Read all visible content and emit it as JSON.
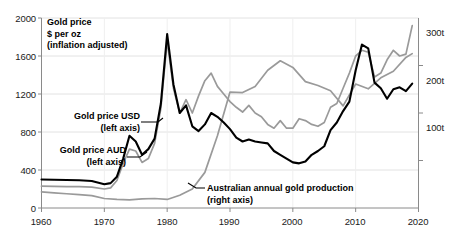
{
  "chart_data": {
    "type": "line",
    "title": "Gold price\n$ per oz\n(inflation adjusted)",
    "xlabel": "",
    "ylabel": "Gold price $ per oz (inflation adjusted)",
    "y2label": "Australian annual gold production (tonnes)",
    "xlim": [
      1960,
      2020
    ],
    "ylim": [
      0,
      2000
    ],
    "y2lim": [
      0,
      400
    ],
    "grid": true,
    "legend_position": "inline-annotations",
    "x_ticks": [
      "1960",
      "1970",
      "1980",
      "1990",
      "2000",
      "2010",
      "2020"
    ],
    "x_tick_values": [
      1960,
      1970,
      1980,
      1990,
      2000,
      2010,
      2020
    ],
    "y_left_ticks": [
      "0",
      "400",
      "800",
      "1200",
      "1600",
      "2000"
    ],
    "y_left_tick_values": [
      0,
      400,
      800,
      1200,
      1600,
      2000
    ],
    "y_right_ticks": [
      "100t",
      "200t",
      "300t"
    ],
    "y_right_tick_values": [
      100,
      200,
      300
    ],
    "annotations": [
      {
        "id": "title-block",
        "text_lines": [
          "Gold price",
          "$ per oz",
          "(inflation adjusted)"
        ]
      },
      {
        "id": "usd-label",
        "text_lines": [
          "Gold price USD",
          "(left axis)"
        ]
      },
      {
        "id": "aud-label",
        "text_lines": [
          "Gold price AUD",
          "(left axis)"
        ]
      },
      {
        "id": "production-label",
        "text_lines": [
          "Australian annual gold production",
          "(right axis)"
        ]
      }
    ],
    "colors": {
      "gold_price_usd": "#000000",
      "gold_price_aud": "#9a9a9a",
      "production": "#9a9a9a",
      "grid": "#e2e2e2",
      "axis": "#8a8a8a",
      "text": "#111111"
    },
    "series": [
      {
        "name": "Gold price USD (left axis)",
        "axis": "left",
        "color": "#000000",
        "unit": "USD per oz (inflation adjusted)",
        "x": [
          1960,
          1962,
          1964,
          1966,
          1968,
          1970,
          1971,
          1972,
          1973,
          1974,
          1975,
          1976,
          1977,
          1978,
          1979,
          1980,
          1981,
          1982,
          1983,
          1984,
          1985,
          1986,
          1987,
          1988,
          1989,
          1990,
          1991,
          1992,
          1993,
          1994,
          1995,
          1996,
          1997,
          1998,
          1999,
          2000,
          2001,
          2002,
          2003,
          2004,
          2005,
          2006,
          2007,
          2008,
          2009,
          2010,
          2011,
          2012,
          2013,
          2014,
          2015,
          2016,
          2017,
          2018,
          2019
        ],
        "y": [
          300,
          298,
          295,
          292,
          285,
          250,
          262,
          330,
          520,
          760,
          700,
          560,
          620,
          730,
          1100,
          1830,
          1300,
          1000,
          1080,
          860,
          810,
          880,
          1000,
          960,
          900,
          830,
          740,
          700,
          720,
          700,
          690,
          680,
          600,
          560,
          520,
          480,
          470,
          490,
          560,
          600,
          650,
          820,
          900,
          1020,
          1120,
          1450,
          1720,
          1680,
          1320,
          1260,
          1150,
          1250,
          1270,
          1230,
          1310
        ]
      },
      {
        "name": "Gold price AUD (left axis)",
        "axis": "left",
        "color": "#9a9a9a",
        "unit": "AUD per oz (inflation adjusted)",
        "x": [
          1960,
          1962,
          1964,
          1966,
          1968,
          1970,
          1971,
          1972,
          1973,
          1974,
          1975,
          1976,
          1977,
          1978,
          1979,
          1980,
          1981,
          1982,
          1983,
          1984,
          1985,
          1986,
          1987,
          1988,
          1989,
          1990,
          1991,
          1992,
          1993,
          1994,
          1995,
          1996,
          1997,
          1998,
          1999,
          2000,
          2001,
          2002,
          2003,
          2004,
          2005,
          2006,
          2007,
          2008,
          2009,
          2010,
          2011,
          2012,
          2013,
          2014,
          2015,
          2016,
          2017,
          2018,
          2019
        ],
        "y": [
          230,
          228,
          226,
          224,
          220,
          200,
          212,
          290,
          470,
          620,
          600,
          480,
          520,
          680,
          1050,
          1760,
          1260,
          1000,
          1140,
          1000,
          1180,
          1340,
          1420,
          1280,
          1200,
          1120,
          1060,
          1010,
          1080,
          1000,
          960,
          880,
          840,
          920,
          840,
          840,
          940,
          920,
          880,
          860,
          900,
          1060,
          1100,
          1260,
          1420,
          1600,
          1660,
          1640,
          1380,
          1420,
          1560,
          1660,
          1600,
          1620,
          1920
        ]
      },
      {
        "name": "Australian annual gold production (right axis)",
        "axis": "right",
        "color": "#9a9a9a",
        "unit": "tonnes",
        "x": [
          1960,
          1962,
          1964,
          1966,
          1968,
          1970,
          1972,
          1974,
          1976,
          1978,
          1980,
          1982,
          1984,
          1986,
          1988,
          1990,
          1992,
          1994,
          1996,
          1998,
          2000,
          2002,
          2004,
          2006,
          2008,
          2010,
          2012,
          2014,
          2016,
          2018,
          2019
        ],
        "y": [
          34,
          32,
          30,
          28,
          26,
          20,
          18,
          17,
          19,
          20,
          18,
          27,
          40,
          75,
          152,
          244,
          243,
          256,
          290,
          310,
          296,
          266,
          258,
          247,
          215,
          261,
          251,
          274,
          288,
          317,
          325
        ]
      }
    ]
  },
  "axis_labels": {
    "left": [
      {
        "value": 2000,
        "text": "2000"
      },
      {
        "value": 1600,
        "text": "1600"
      },
      {
        "value": 1200,
        "text": "1200"
      },
      {
        "value": 800,
        "text": "800"
      },
      {
        "value": 400,
        "text": "400"
      },
      {
        "value": 0,
        "text": "0"
      }
    ],
    "right": [
      {
        "value": 300,
        "text": "300t"
      },
      {
        "value": 200,
        "text": "200t"
      },
      {
        "value": 100,
        "text": "100t"
      }
    ],
    "bottom": [
      {
        "value": 1960,
        "text": "1960"
      },
      {
        "value": 1970,
        "text": "1970"
      },
      {
        "value": 1980,
        "text": "1980"
      },
      {
        "value": 1990,
        "text": "1990"
      },
      {
        "value": 2000,
        "text": "2000"
      },
      {
        "value": 2010,
        "text": "2010"
      },
      {
        "value": 2020,
        "text": "2020"
      }
    ]
  },
  "annotations": {
    "title_line1": "Gold price",
    "title_line2": "$ per oz",
    "title_line3": "(inflation adjusted)",
    "usd_line1": "Gold price USD",
    "usd_line2": "(left axis)",
    "aud_line1": "Gold price AUD",
    "aud_line2": "(left axis)",
    "prod_line1": "Australian annual gold production",
    "prod_line2": "(right axis)"
  }
}
